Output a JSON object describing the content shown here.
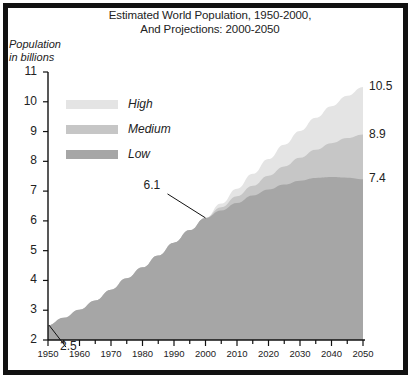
{
  "chart_data": {
    "type": "area",
    "title": "Estimated World Population, 1950-2000, And Projections: 2000-2050",
    "title_line1": "Estimated World Population, 1950-2000,",
    "title_line2": "And Projections: 2000-2050",
    "ylabel": "Population in billions",
    "ylabel_line1": "Population",
    "ylabel_line2": "in billions",
    "xlabel": "",
    "xlim": [
      1950,
      2050
    ],
    "ylim": [
      2,
      11
    ],
    "yticks": [
      11,
      10,
      9,
      8,
      7,
      6,
      5,
      4,
      3,
      2
    ],
    "xticks": [
      1950,
      1960,
      1970,
      1980,
      1990,
      2000,
      2010,
      2020,
      2030,
      2040,
      2050
    ],
    "xminor_step": 5,
    "grid": false,
    "legend_position": "upper-left-inside",
    "legend": [
      {
        "name": "High",
        "color": "#e4e4e4"
      },
      {
        "name": "Medium",
        "color": "#c6c6c6"
      },
      {
        "name": "Low",
        "color": "#a6a6a6"
      }
    ],
    "annotations": [
      {
        "label": "2.5",
        "x": 1950,
        "y": 2.5,
        "placement": "leader-up-right"
      },
      {
        "label": "6.1",
        "x": 2000,
        "y": 6.1,
        "placement": "leader-up-left"
      }
    ],
    "end_labels": [
      {
        "label": "10.5",
        "series": "High",
        "x": 2050,
        "y": 10.5
      },
      {
        "label": "8.9",
        "series": "Medium",
        "x": 2050,
        "y": 8.9
      },
      {
        "label": "7.4",
        "series": "Low",
        "x": 2050,
        "y": 7.4
      }
    ],
    "x": [
      1950,
      1955,
      1960,
      1965,
      1970,
      1975,
      1980,
      1985,
      1990,
      1995,
      2000,
      2005,
      2010,
      2015,
      2020,
      2025,
      2030,
      2035,
      2040,
      2045,
      2050
    ],
    "series": [
      {
        "name": "High",
        "color": "#e4e4e4",
        "values": [
          2.5,
          2.75,
          3.02,
          3.33,
          3.69,
          4.07,
          4.44,
          4.84,
          5.27,
          5.69,
          6.1,
          6.58,
          7.08,
          7.58,
          8.08,
          8.56,
          9.02,
          9.46,
          9.85,
          10.2,
          10.5
        ]
      },
      {
        "name": "Medium",
        "color": "#c6c6c6",
        "values": [
          2.5,
          2.75,
          3.02,
          3.33,
          3.69,
          4.07,
          4.44,
          4.84,
          5.27,
          5.69,
          6.1,
          6.46,
          6.83,
          7.18,
          7.52,
          7.83,
          8.12,
          8.39,
          8.61,
          8.78,
          8.9
        ]
      },
      {
        "name": "Low",
        "color": "#a6a6a6",
        "values": [
          2.5,
          2.75,
          3.02,
          3.33,
          3.69,
          4.07,
          4.44,
          4.84,
          5.27,
          5.69,
          6.1,
          6.35,
          6.6,
          6.85,
          7.05,
          7.22,
          7.35,
          7.44,
          7.47,
          7.45,
          7.4
        ]
      }
    ]
  },
  "credit": {
    "signature": "Stuart Zastrow"
  }
}
